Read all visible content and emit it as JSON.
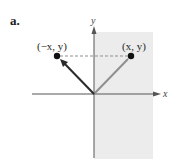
{
  "figure": {
    "part_label": "a.",
    "axes": {
      "x_label": "x",
      "y_label": "y"
    },
    "points": [
      {
        "label": "(−x, y)",
        "role": "reflected-point"
      },
      {
        "label": "(x, y)",
        "role": "original-point"
      }
    ],
    "colors": {
      "background": "#ffffff",
      "shaded_region": "#ececec",
      "axes": "#555555",
      "reflected_vector": "#2b2b2b",
      "original_vector": "#8f8f8f",
      "dashed_line": "#8f8f8f",
      "points": "#111111"
    }
  }
}
